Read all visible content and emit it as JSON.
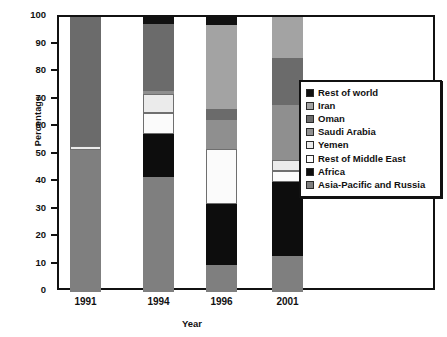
{
  "chart_data": {
    "type": "bar",
    "subtype": "stacked-percentage",
    "title": "",
    "xlabel": "Year",
    "ylabel": "Percentage",
    "categories": [
      "1991",
      "1994",
      "1996",
      "2001"
    ],
    "ylim": [
      0,
      100
    ],
    "y_ticks": [
      0,
      10,
      20,
      30,
      40,
      50,
      60,
      70,
      80,
      90,
      100
    ],
    "grid": false,
    "legend_position": "center-right",
    "stack_order_bottom_to_top": [
      "Asia-Pacific and Russia",
      "Africa",
      "Rest of Middle East",
      "Yemen",
      "Saudi Arabia",
      "Oman",
      "Iran",
      "Rest of world"
    ],
    "series": [
      {
        "name": "Rest of world",
        "color": "#111111",
        "values": [
          0.0,
          2.5,
          3.0,
          0.0
        ]
      },
      {
        "name": "Iran",
        "color": "#a3a3a3",
        "values": [
          0.0,
          0.0,
          30.5,
          15.0
        ]
      },
      {
        "name": "Oman",
        "color": "#6b6b6b",
        "values": [
          47.0,
          24.5,
          4.0,
          17.0
        ]
      },
      {
        "name": "Saudi Arabia",
        "color": "#8f8f8f",
        "values": [
          0.0,
          1.0,
          10.5,
          20.0
        ]
      },
      {
        "name": "Yemen",
        "color": "#ebebeb",
        "values": [
          1.5,
          7.0,
          0.0,
          4.0
        ]
      },
      {
        "name": "Rest of Middle East",
        "color": "#fbfbfb",
        "values": [
          0.0,
          7.5,
          20.0,
          4.0
        ]
      },
      {
        "name": "Africa",
        "color": "#0d0d0d",
        "values": [
          0.0,
          15.5,
          22.0,
          27.0
        ]
      },
      {
        "name": "Asia-Pacific and Russia",
        "color": "#7f7f7f",
        "values": [
          51.5,
          42.0,
          10.0,
          13.0
        ]
      }
    ]
  },
  "axes": {
    "y_title": "Percentage",
    "x_title": "Year",
    "y_tick_labels": [
      "100",
      "90",
      "80",
      "70",
      "60",
      "50",
      "40",
      "30",
      "20",
      "10",
      "0"
    ],
    "x_tick_labels": [
      "1991",
      "1994",
      "1996",
      "2001"
    ]
  },
  "legend": {
    "items": [
      {
        "label": "Rest of world",
        "color": "#111111"
      },
      {
        "label": "Iran",
        "color": "#a3a3a3"
      },
      {
        "label": "Oman",
        "color": "#6b6b6b"
      },
      {
        "label": "Saudi Arabia",
        "color": "#8f8f8f"
      },
      {
        "label": "Yemen",
        "color": "#ebebeb"
      },
      {
        "label": "Rest of Middle East",
        "color": "#fbfbfb"
      },
      {
        "label": "Africa",
        "color": "#0d0d0d"
      },
      {
        "label": "Asia-Pacific and Russia",
        "color": "#7f7f7f"
      }
    ]
  }
}
